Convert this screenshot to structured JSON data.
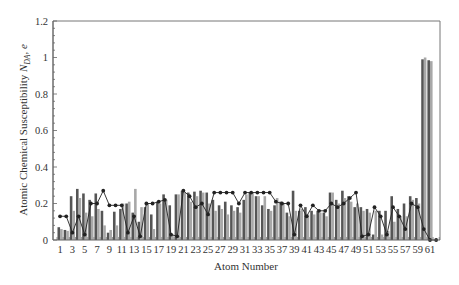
{
  "chart_data": {
    "type": "bar",
    "title": "",
    "xlabel": "Atom Number",
    "ylabel": "Atomic Chemical Susceptibility N_DA, e",
    "ylabel_parts": {
      "main": "Atomic Chemical Susceptibility ",
      "var": "N",
      "sub": "DA",
      "unit": ", e"
    },
    "ylim": [
      0,
      1.2
    ],
    "yticks": [
      0,
      0.2,
      0.4,
      0.6,
      0.8,
      1,
      1.2
    ],
    "ytick_labels": [
      "0",
      "0.2",
      "0.4",
      "0.6",
      "0.8",
      "1",
      "1.2"
    ],
    "xtick_labels": [
      "1",
      "3",
      "5",
      "7",
      "9",
      "11",
      "13",
      "15",
      "17",
      "19",
      "21",
      "23",
      "25",
      "27",
      "29",
      "31",
      "33",
      "35",
      "37",
      "39",
      "41",
      "43",
      "45",
      "47",
      "49",
      "51",
      "53",
      "55",
      "57",
      "59",
      "61"
    ],
    "grid": false,
    "legend": "none",
    "categories": [
      1,
      2,
      3,
      4,
      5,
      6,
      7,
      8,
      9,
      10,
      11,
      12,
      13,
      14,
      15,
      16,
      17,
      18,
      19,
      20,
      21,
      22,
      23,
      24,
      25,
      26,
      27,
      28,
      29,
      30,
      31,
      32,
      33,
      34,
      35,
      36,
      37,
      38,
      39,
      40,
      41,
      42,
      43,
      44,
      45,
      46,
      47,
      48,
      49,
      50,
      51,
      52,
      53,
      54,
      55,
      56,
      57,
      58,
      59,
      60,
      61,
      62
    ],
    "series": [
      {
        "name": "dark bars",
        "kind": "bar",
        "color": "#555555",
        "values": [
          0.07,
          0.055,
          0.24,
          0.28,
          0.255,
          0.22,
          0.255,
          0.16,
          0.04,
          0.155,
          0.17,
          0.2,
          0.15,
          0.1,
          0.18,
          0.14,
          0.21,
          0.25,
          0.19,
          0.25,
          0.27,
          0.26,
          0.265,
          0.27,
          0.26,
          0.22,
          0.19,
          0.21,
          0.19,
          0.18,
          0.22,
          0.26,
          0.24,
          0.19,
          0.17,
          0.19,
          0.21,
          0.15,
          0.27,
          0.16,
          0.18,
          0.16,
          0.16,
          0.15,
          0.26,
          0.22,
          0.27,
          0.24,
          0.18,
          0.18,
          0.17,
          0.03,
          0.16,
          0.16,
          0.24,
          0.17,
          0.2,
          0.24,
          0.23,
          0.99,
          0.985,
          0.0
        ]
      },
      {
        "name": "light bars",
        "kind": "bar",
        "color": "#a8a8a8",
        "values": [
          0.06,
          0.05,
          0.16,
          0.23,
          0.15,
          0.13,
          0.17,
          0.08,
          0.055,
          0.08,
          0.2,
          0.21,
          0.28,
          0.18,
          0.2,
          0.06,
          0.2,
          0.22,
          0.03,
          0.25,
          0.26,
          0.21,
          0.24,
          0.26,
          0.2,
          0.16,
          0.17,
          0.14,
          0.16,
          0.15,
          0.25,
          0.26,
          0.24,
          0.24,
          0.16,
          0.23,
          0.2,
          0.13,
          0.16,
          0.17,
          0.14,
          0.14,
          0.15,
          0.13,
          0.26,
          0.2,
          0.23,
          0.21,
          0.2,
          0.16,
          0.15,
          0.16,
          0.03,
          0.05,
          0.1,
          0.13,
          0.13,
          0.22,
          0.2,
          1.0,
          0.98,
          0.0
        ]
      },
      {
        "name": "line",
        "kind": "line",
        "color": "#222222",
        "values": [
          0.13,
          0.13,
          0.04,
          0.13,
          0.03,
          0.2,
          0.2,
          0.27,
          0.19,
          0.19,
          0.19,
          0.04,
          0.13,
          0.02,
          0.2,
          0.2,
          0.21,
          0.22,
          0.03,
          0.02,
          0.27,
          0.24,
          0.18,
          0.2,
          0.14,
          0.26,
          0.26,
          0.26,
          0.26,
          0.2,
          0.26,
          0.26,
          0.26,
          0.26,
          0.26,
          0.21,
          0.2,
          0.2,
          0.03,
          0.19,
          0.13,
          0.19,
          0.16,
          0.16,
          0.2,
          0.18,
          0.2,
          0.23,
          0.26,
          0.02,
          0.03,
          0.18,
          0.13,
          0.03,
          0.18,
          0.13,
          0.06,
          0.2,
          0.18,
          0.06,
          0.0,
          0.0
        ]
      }
    ],
    "colors": {
      "axis": "#666666",
      "frame": "#777777",
      "dark_bar": "#555555",
      "light_bar": "#a8a8a8",
      "line": "#222222"
    }
  }
}
